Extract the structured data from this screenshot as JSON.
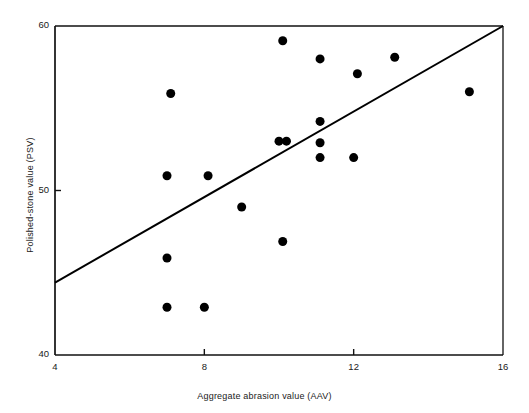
{
  "figure": {
    "background": "#ffffff",
    "ink_color": "#111111"
  },
  "chart_data": {
    "type": "scatter",
    "title": "",
    "xlabel": "Aggregate abrasion value (AAV)",
    "ylabel": "Polished-stone value (PSV)",
    "xlim": [
      4,
      16
    ],
    "ylim": [
      40,
      60
    ],
    "xticks": [
      4,
      8,
      12,
      16
    ],
    "xtick_labels": [
      "4",
      "8",
      "12",
      "16"
    ],
    "yticks": [
      40,
      50,
      60
    ],
    "ytick_labels": [
      "40",
      "50",
      "60"
    ],
    "grid": false,
    "legend": null,
    "marker": {
      "shape": "circle",
      "color": "#000000",
      "size_px": 9
    },
    "x": [
      7.1,
      7.0,
      8.1,
      7.0,
      7.0,
      8.0,
      9.0,
      10.1,
      10.0,
      10.2,
      10.1,
      11.1,
      11.1,
      11.1,
      11.1,
      12.1,
      12.0,
      13.1,
      15.1
    ],
    "y": [
      55.9,
      50.9,
      50.9,
      45.9,
      42.9,
      42.9,
      49.0,
      59.1,
      53.0,
      53.0,
      46.9,
      58.0,
      54.2,
      52.9,
      52.0,
      57.1,
      52.0,
      58.1,
      56.0
    ],
    "points": [
      {
        "x": 7.1,
        "y": 55.9
      },
      {
        "x": 7.0,
        "y": 50.9
      },
      {
        "x": 8.1,
        "y": 50.9
      },
      {
        "x": 7.0,
        "y": 45.9
      },
      {
        "x": 7.0,
        "y": 42.9
      },
      {
        "x": 8.0,
        "y": 42.9
      },
      {
        "x": 9.0,
        "y": 49.0
      },
      {
        "x": 10.1,
        "y": 59.1
      },
      {
        "x": 10.0,
        "y": 53.0
      },
      {
        "x": 10.2,
        "y": 53.0
      },
      {
        "x": 10.1,
        "y": 46.9
      },
      {
        "x": 11.1,
        "y": 58.0
      },
      {
        "x": 11.1,
        "y": 54.2
      },
      {
        "x": 11.1,
        "y": 52.9
      },
      {
        "x": 11.1,
        "y": 52.0
      },
      {
        "x": 12.1,
        "y": 57.1
      },
      {
        "x": 12.0,
        "y": 52.0
      },
      {
        "x": 13.1,
        "y": 58.1
      },
      {
        "x": 15.1,
        "y": 56.0
      }
    ],
    "fit_line": {
      "kind": "linear-regression",
      "x0": 4,
      "y0": 44.4,
      "x1": 16,
      "y1": 60.0,
      "color": "#000000",
      "width_px": 2
    }
  }
}
